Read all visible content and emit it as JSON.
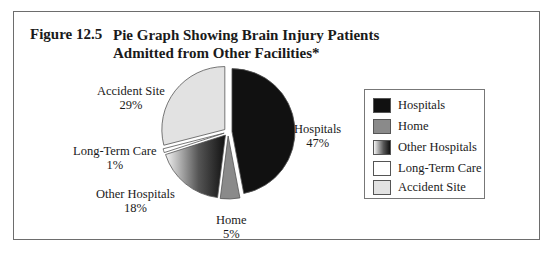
{
  "figure": {
    "number": "Figure 12.5",
    "title": "Pie Graph Showing Brain Injury Patients Admitted from Other Facilities*"
  },
  "labels": {
    "hospitals": {
      "name": "Hospitals",
      "pct": "47%"
    },
    "home": {
      "name": "Home",
      "pct": "5%"
    },
    "other_hospitals": {
      "name": "Other Hospitals",
      "pct": "18%"
    },
    "long_term_care": {
      "name": "Long-Term Care",
      "pct": "1%"
    },
    "accident_site": {
      "name": "Accident Site",
      "pct": "29%"
    }
  },
  "legend": {
    "items": [
      {
        "label": "Hospitals",
        "color": "#111111"
      },
      {
        "label": "Home",
        "color": "#8a8a8a"
      },
      {
        "label": "Other Hospitals",
        "color": "gradient"
      },
      {
        "label": "Long-Term Care",
        "color": "#ffffff"
      },
      {
        "label": "Accident Site",
        "color": "#e2e2e2"
      }
    ]
  },
  "chart_data": {
    "type": "pie",
    "title": "Pie Graph Showing Brain Injury Patients Admitted from Other Facilities*",
    "categories": [
      "Hospitals",
      "Home",
      "Other Hospitals",
      "Long-Term Care",
      "Accident Site"
    ],
    "values": [
      47,
      5,
      18,
      1,
      29
    ],
    "unit": "%",
    "colors": [
      "#111111",
      "#8a8a8a",
      "gradient-white-to-black",
      "#ffffff",
      "#e2e2e2"
    ],
    "exploded": true,
    "legend_position": "right",
    "start_angle": "12 o'clock",
    "direction": "clockwise"
  }
}
